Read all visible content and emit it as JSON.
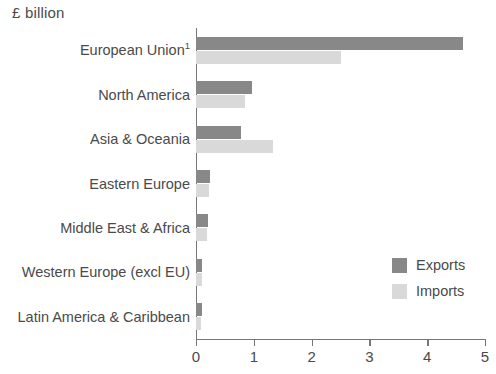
{
  "chart_data": {
    "type": "bar",
    "orientation": "horizontal",
    "title": "£ billion",
    "xlabel": "",
    "ylabel": "",
    "xlim": [
      0,
      5
    ],
    "xticks": [
      "0",
      "1",
      "2",
      "3",
      "4",
      "5"
    ],
    "grid": false,
    "legend_position": "right-center",
    "categories": [
      "European Union",
      "North America",
      "Asia & Oceania",
      "Eastern Europe",
      "Middle East & Africa",
      "Western Europe (excl EU)",
      "Latin America & Caribbean"
    ],
    "category_footnote_markers": [
      "1",
      "",
      "",
      "",
      "",
      "",
      ""
    ],
    "series": [
      {
        "name": "Exports",
        "color": "#888888",
        "values": [
          4.62,
          0.97,
          0.78,
          0.25,
          0.21,
          0.11,
          0.1
        ]
      },
      {
        "name": "Imports",
        "color": "#d9d9d9",
        "values": [
          2.5,
          0.85,
          1.33,
          0.22,
          0.19,
          0.1,
          0.09
        ]
      }
    ]
  },
  "legend": {
    "entries": [
      {
        "label": "Exports",
        "color": "#888888"
      },
      {
        "label": "Imports",
        "color": "#d9d9d9"
      }
    ]
  },
  "axis": {
    "line_color": "#777777",
    "tick_labels": [
      "0",
      "1",
      "2",
      "3",
      "4",
      "5"
    ]
  }
}
